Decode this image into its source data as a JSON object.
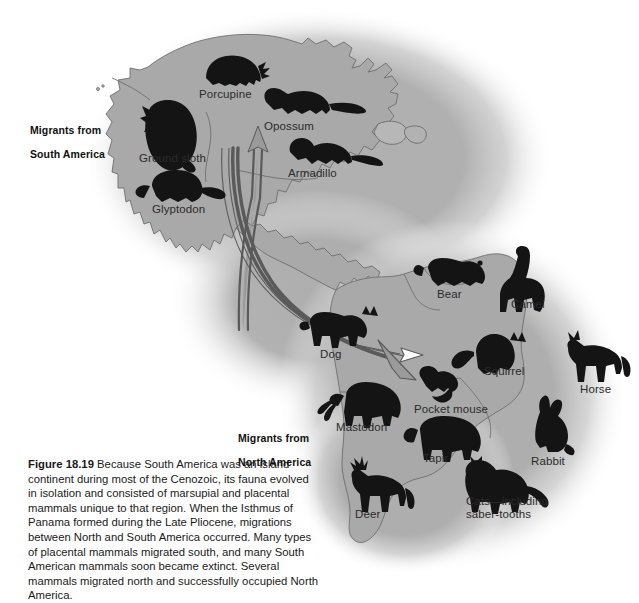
{
  "figure": {
    "number": "Figure 18.19",
    "caption_text": " Because South America was an island continent during most of the Cenozoic, its fauna evolved in isolation and consisted of marsupial and placental mammals unique to that region. When the Isthmus of Panama formed during the Late Pliocene, migrations between North and South America occurred. Many types of placental mammals migrated south, and many South American mammals soon became extinct. Several mammals migrated north and successfully occupied North America."
  },
  "colors": {
    "page_background": "#ffffff",
    "landmass_fill": "#a9a9a9",
    "landmass_halo": "#b3b3b3",
    "coastline_stroke": "#6e6e6e",
    "animal_silhouette": "#141414",
    "arrow_fill": "#ffffff",
    "arrow_stroke": "#5a5a5a",
    "arrow_solid_fill": "#9a9a9a",
    "label_text": "#2b2b2b",
    "caption_text": "#1a1a1a"
  },
  "direction_labels": [
    {
      "id": "migrants-from-south-america",
      "line1": "Migrants from",
      "line2": "South America",
      "x": 30,
      "y": 112
    },
    {
      "id": "migrants-from-north-america",
      "line1": "Migrants from",
      "line2": "North America",
      "x": 238,
      "y": 420
    }
  ],
  "animals": [
    {
      "id": "porcupine",
      "label": "Porcupine",
      "label_x": 199,
      "label_y": 88,
      "icon_x": 206,
      "icon_y": 56,
      "continent": "north-america"
    },
    {
      "id": "opossum",
      "label": "Opossum",
      "label_x": 264,
      "label_y": 120,
      "icon_x": 265,
      "icon_y": 90,
      "continent": "north-america"
    },
    {
      "id": "ground-sloth",
      "label": "Ground sloth",
      "label_x": 139,
      "label_y": 152,
      "icon_x": 145,
      "icon_y": 104,
      "continent": "north-america"
    },
    {
      "id": "armadillo",
      "label": "Armadillo",
      "label_x": 288,
      "label_y": 167,
      "icon_x": 288,
      "icon_y": 138,
      "continent": "north-america"
    },
    {
      "id": "glyptodon",
      "label": "Glyptodon",
      "label_x": 152,
      "label_y": 203,
      "icon_x": 150,
      "icon_y": 172,
      "continent": "north-america"
    },
    {
      "id": "bear",
      "label": "Bear",
      "label_x": 437,
      "label_y": 288,
      "icon_x": 428,
      "icon_y": 258,
      "continent": "south-america"
    },
    {
      "id": "camel",
      "label": "Camel",
      "label_x": 511,
      "label_y": 298,
      "icon_x": 508,
      "icon_y": 256,
      "continent": "south-america"
    },
    {
      "id": "dog",
      "label": "Dog",
      "label_x": 320,
      "label_y": 348,
      "icon_x": 309,
      "icon_y": 313,
      "continent": "south-america"
    },
    {
      "id": "squirrel",
      "label": "Squirrel",
      "label_x": 484,
      "label_y": 365,
      "icon_x": 472,
      "icon_y": 333,
      "continent": "south-america"
    },
    {
      "id": "horse",
      "label": "Horse",
      "label_x": 580,
      "label_y": 383,
      "icon_x": 565,
      "icon_y": 340,
      "continent": "south-america"
    },
    {
      "id": "pocket-mouse",
      "label": "Pocket mouse",
      "label_x": 414,
      "label_y": 403,
      "icon_x": 421,
      "icon_y": 370,
      "continent": "south-america"
    },
    {
      "id": "mastodon",
      "label": "Mastodon",
      "label_x": 336,
      "label_y": 421,
      "icon_x": 338,
      "icon_y": 388,
      "continent": "south-america"
    },
    {
      "id": "tapir",
      "label": "Tapir",
      "label_x": 423,
      "label_y": 452,
      "icon_x": 419,
      "icon_y": 419,
      "continent": "south-america"
    },
    {
      "id": "rabbit",
      "label": "Rabbit",
      "label_x": 531,
      "label_y": 455,
      "icon_x": 534,
      "icon_y": 411,
      "continent": "south-america"
    },
    {
      "id": "deer",
      "label": "Deer",
      "label_x": 355,
      "label_y": 508,
      "icon_x": 343,
      "icon_y": 461,
      "continent": "south-america"
    },
    {
      "id": "cats",
      "label": "Cats—including\nsaber-tooths",
      "label_x": 466,
      "label_y": 501,
      "icon_x": 466,
      "icon_y": 464,
      "continent": "south-america"
    }
  ],
  "arrows": [
    {
      "id": "northward-migration-arrow",
      "direction": "north",
      "description": "Arrow pointing north toward Opossum label"
    },
    {
      "id": "southward-migration-arrow-outline-a",
      "direction": "south",
      "description": "Outlined arrow sweeping southeast toward Bear"
    },
    {
      "id": "southward-migration-arrow-solid",
      "direction": "south",
      "description": "Solid arrow pointing southeast toward Pocket mouse"
    }
  ]
}
